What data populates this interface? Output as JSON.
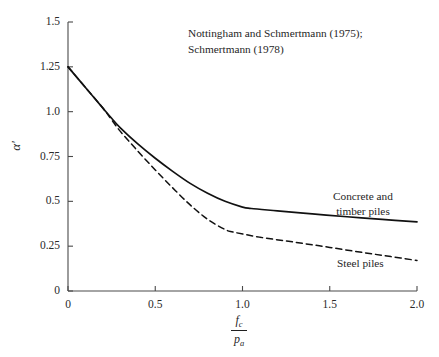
{
  "chart_data": {
    "type": "line",
    "title": "",
    "subtitle": "",
    "annotation_line1": "Nottingham and Schmertmann (1975);",
    "annotation_line2": "Schmertmann (1978)",
    "xlabel_numerator": "f",
    "xlabel_numerator_sub": "c",
    "xlabel_denominator": "p",
    "xlabel_denominator_sub": "a",
    "ylabel": "α′",
    "xlim": [
      0,
      2.0
    ],
    "ylim": [
      0,
      1.5
    ],
    "xticks": [
      "0",
      "0.5",
      "1.0",
      "1.5",
      "2.0"
    ],
    "xtick_values": [
      0,
      0.5,
      1.0,
      1.5,
      2.0
    ],
    "yticks": [
      "0",
      "0.25",
      "0.5",
      "0.75",
      "1.0",
      "1.25",
      "1.5"
    ],
    "ytick_values": [
      0,
      0.25,
      0.5,
      0.75,
      1.0,
      1.25,
      1.5
    ],
    "grid": false,
    "legend_position": "inline-annotations",
    "series": [
      {
        "name": "Concrete and timber piles",
        "label_line1": "Concrete and",
        "label_line2": "timber piles",
        "style": "solid",
        "color": "#111111",
        "x": [
          0.0,
          0.1,
          0.2,
          0.25,
          0.3,
          0.4,
          0.5,
          0.6,
          0.7,
          0.8,
          0.9,
          1.0,
          1.05,
          1.2,
          1.4,
          1.6,
          1.8,
          2.0
        ],
        "y": [
          1.25,
          1.135,
          1.02,
          0.963,
          0.91,
          0.82,
          0.74,
          0.667,
          0.6,
          0.545,
          0.5,
          0.468,
          0.46,
          0.447,
          0.43,
          0.414,
          0.399,
          0.385
        ]
      },
      {
        "name": "Steel piles",
        "label_line1": "Steel piles",
        "style": "dashed",
        "color": "#111111",
        "x": [
          0.0,
          0.1,
          0.2,
          0.25,
          0.3,
          0.4,
          0.5,
          0.6,
          0.7,
          0.8,
          0.9,
          0.95,
          1.1,
          1.3,
          1.5,
          1.7,
          1.85,
          2.0
        ],
        "y": [
          1.25,
          1.135,
          1.02,
          0.955,
          0.89,
          0.78,
          0.675,
          0.575,
          0.48,
          0.4,
          0.343,
          0.328,
          0.3,
          0.272,
          0.243,
          0.213,
          0.192,
          0.17
        ]
      }
    ]
  },
  "geometry": {
    "plot_left": 68,
    "plot_right": 417,
    "plot_top": 22,
    "plot_bottom": 291
  }
}
